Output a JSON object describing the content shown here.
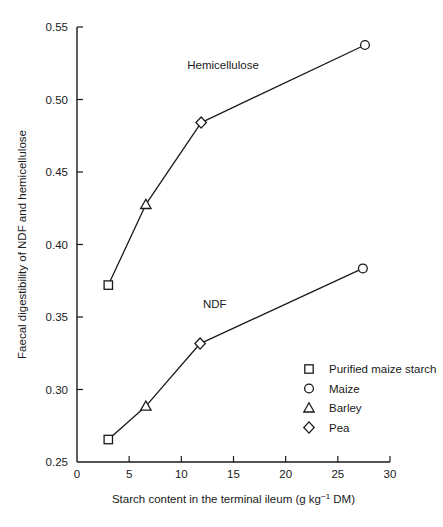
{
  "chart_data": {
    "type": "line",
    "title": "",
    "xlabel": "Starch content in the terminal ileum (g kg-1 DM)",
    "xlabel_main": "Starch content in the terminal ileum (g kg",
    "xlabel_sup": "−1",
    "xlabel_tail": " DM)",
    "ylabel": "Faecal digestibility of NDF and hemicellulose",
    "xlim": [
      0,
      30
    ],
    "ylim": [
      0.25,
      0.55
    ],
    "xticks": [
      "0",
      "5",
      "10",
      "15",
      "20",
      "25",
      "30"
    ],
    "xtick_values": [
      0,
      5,
      10,
      15,
      20,
      25,
      30
    ],
    "yticks": [
      "0.25",
      "0.30",
      "0.35",
      "0.40",
      "0.45",
      "0.50",
      "0.55"
    ],
    "ytick_values": [
      0.25,
      0.3,
      0.35,
      0.4,
      0.45,
      0.5,
      0.55
    ],
    "grid": false,
    "legend_position": "bottom-right",
    "tick_direction": "in",
    "series": [
      {
        "name": "Hemicellulose",
        "label_x": 14.0,
        "label_y": 0.521,
        "points": [
          {
            "x": 3.0,
            "y": 0.372,
            "marker": "square",
            "sample": "Purified maize starch"
          },
          {
            "x": 6.6,
            "y": 0.4276,
            "marker": "triangle",
            "sample": "Barley"
          },
          {
            "x": 11.9,
            "y": 0.4841,
            "marker": "diamond",
            "sample": "Pea"
          },
          {
            "x": 27.6,
            "y": 0.5376,
            "marker": "circle",
            "sample": "Maize"
          }
        ]
      },
      {
        "name": "NDF",
        "label_x": 13.2,
        "label_y": 0.3565,
        "points": [
          {
            "x": 3.0,
            "y": 0.2655,
            "marker": "square",
            "sample": "Purified maize starch"
          },
          {
            "x": 6.6,
            "y": 0.2885,
            "marker": "triangle",
            "sample": "Barley"
          },
          {
            "x": 11.8,
            "y": 0.3317,
            "marker": "diamond",
            "sample": "Pea"
          },
          {
            "x": 27.4,
            "y": 0.3835,
            "marker": "circle",
            "sample": "Maize"
          }
        ]
      }
    ],
    "legend": [
      {
        "marker": "square",
        "label": "Purified maize starch"
      },
      {
        "marker": "circle",
        "label": "Maize"
      },
      {
        "marker": "triangle",
        "label": "Barley"
      },
      {
        "marker": "diamond",
        "label": "Pea"
      }
    ],
    "colors": {
      "line": "#1a1a1a",
      "marker_fill": "#ffffff",
      "axis": "#1a1a1a",
      "background": "#ffffff"
    }
  }
}
